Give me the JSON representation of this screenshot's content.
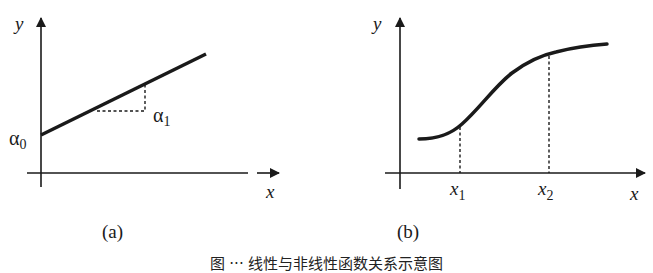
{
  "figure": {
    "panels": [
      {
        "id": "a",
        "label": "(a)",
        "x_axis_label": "x",
        "y_axis_label": "y",
        "intercept_label": "α",
        "intercept_sub": "0",
        "slope_label": "α",
        "slope_sub": "1",
        "description": "straight line with intercept α0 and slope α1"
      },
      {
        "id": "b",
        "label": "(b)",
        "x_axis_label": "x",
        "y_axis_label": "y",
        "marks": [
          {
            "label": "x",
            "sub": "1"
          },
          {
            "label": "x",
            "sub": "2"
          }
        ],
        "description": "S-shaped nonlinear curve with dashed markers at x1 and x2"
      }
    ],
    "caption": "图 ··· 线性与非线性函数关系示意图"
  },
  "colors": {
    "ink": "#1a1a1a",
    "background": "#ffffff"
  }
}
